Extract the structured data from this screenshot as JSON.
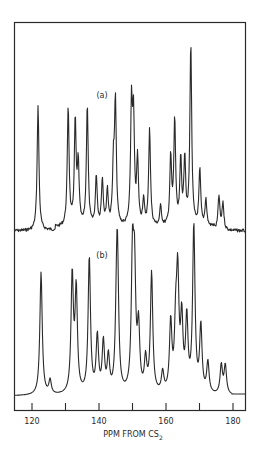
{
  "chart_data": {
    "type": "line",
    "title": "",
    "xlabel": "PPM FROM CS2",
    "xlabel_main": "PPM FROM CS",
    "xlabel_sub": "2",
    "ylabel": "",
    "xlim": [
      117.5,
      184.5
    ],
    "x_ticks": [
      120,
      130,
      140,
      150,
      160,
      170,
      180
    ],
    "x_tick_labels": [
      "120",
      "",
      "140",
      "",
      "160",
      "",
      "180"
    ],
    "grid": false,
    "legend": null,
    "series": [
      {
        "name": "(a)",
        "label": "(a)",
        "style": "noisy experimental spectrum",
        "peaks": [
          {
            "ppm": 121.8,
            "height": 125
          },
          {
            "ppm": 130.8,
            "height": 120
          },
          {
            "ppm": 132.9,
            "height": 104
          },
          {
            "ppm": 133.8,
            "height": 60
          },
          {
            "ppm": 136.5,
            "height": 122
          },
          {
            "ppm": 139.2,
            "height": 50
          },
          {
            "ppm": 141.0,
            "height": 47
          },
          {
            "ppm": 142.5,
            "height": 35
          },
          {
            "ppm": 144.3,
            "height": 55
          },
          {
            "ppm": 144.9,
            "height": 122
          },
          {
            "ppm": 149.7,
            "height": 117
          },
          {
            "ppm": 150.3,
            "height": 100
          },
          {
            "ppm": 151.5,
            "height": 65
          },
          {
            "ppm": 153.3,
            "height": 25
          },
          {
            "ppm": 155.1,
            "height": 98
          },
          {
            "ppm": 158.4,
            "height": 20
          },
          {
            "ppm": 161.4,
            "height": 68
          },
          {
            "ppm": 162.6,
            "height": 105
          },
          {
            "ppm": 164.4,
            "height": 65
          },
          {
            "ppm": 165.6,
            "height": 67
          },
          {
            "ppm": 167.4,
            "height": 183
          },
          {
            "ppm": 170.1,
            "height": 56
          },
          {
            "ppm": 171.9,
            "height": 27
          },
          {
            "ppm": 175.8,
            "height": 34
          },
          {
            "ppm": 177.0,
            "height": 27
          }
        ]
      },
      {
        "name": "(b)",
        "label": "(b)",
        "style": "smooth simulated spectrum",
        "peaks": [
          {
            "ppm": 122.7,
            "height": 123
          },
          {
            "ppm": 125.4,
            "height": 14
          },
          {
            "ppm": 132.0,
            "height": 117
          },
          {
            "ppm": 133.2,
            "height": 102
          },
          {
            "ppm": 137.1,
            "height": 136
          },
          {
            "ppm": 139.5,
            "height": 56
          },
          {
            "ppm": 141.3,
            "height": 50
          },
          {
            "ppm": 142.8,
            "height": 35
          },
          {
            "ppm": 145.2,
            "height": 50
          },
          {
            "ppm": 145.5,
            "height": 130
          },
          {
            "ppm": 150.0,
            "height": 128
          },
          {
            "ppm": 150.6,
            "height": 110
          },
          {
            "ppm": 151.8,
            "height": 62
          },
          {
            "ppm": 153.9,
            "height": 32
          },
          {
            "ppm": 155.7,
            "height": 120
          },
          {
            "ppm": 159.0,
            "height": 20
          },
          {
            "ppm": 161.4,
            "height": 69
          },
          {
            "ppm": 162.9,
            "height": 60
          },
          {
            "ppm": 163.5,
            "height": 109
          },
          {
            "ppm": 164.7,
            "height": 70
          },
          {
            "ppm": 166.2,
            "height": 72
          },
          {
            "ppm": 168.3,
            "height": 167
          },
          {
            "ppm": 170.4,
            "height": 66
          },
          {
            "ppm": 172.5,
            "height": 31
          },
          {
            "ppm": 176.5,
            "height": 29
          },
          {
            "ppm": 177.7,
            "height": 29
          }
        ]
      }
    ]
  },
  "labels": {
    "spectrum_a": "(a)",
    "spectrum_b": "(b)",
    "axis_title_main": "PPM FROM CS",
    "axis_title_sub": "2"
  },
  "colors": {
    "ink": "#2a2a2a",
    "background": "#ffffff"
  }
}
